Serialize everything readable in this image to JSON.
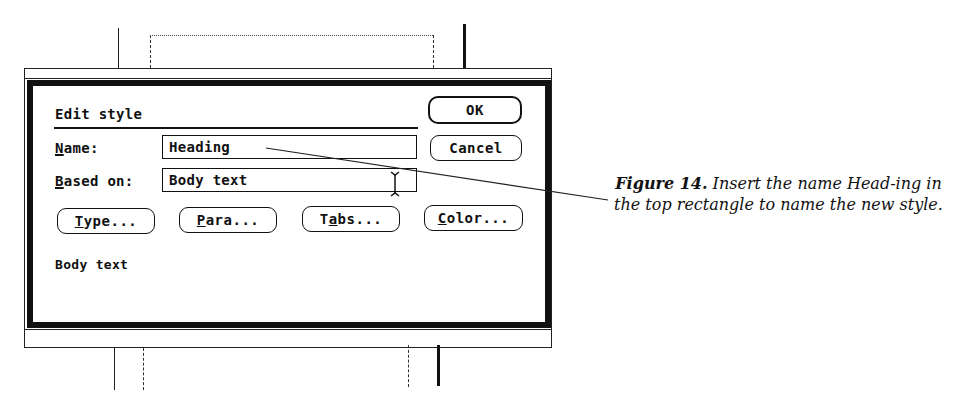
{
  "dialog": {
    "title": "Edit style",
    "name_label_mnemonic": "N",
    "name_label_rest": "ame:",
    "name_value": "Heading",
    "based_on_label_mnemonic": "B",
    "based_on_label_rest": "ased on:",
    "based_on_value": "Body text",
    "ok_label": "OK",
    "cancel_label": "Cancel",
    "buttons": [
      {
        "pre": "",
        "mnemonic": "T",
        "post": "ype..."
      },
      {
        "pre": "",
        "mnemonic": "P",
        "post": "ara..."
      },
      {
        "pre": "T",
        "mnemonic": "a",
        "post": "bs..."
      },
      {
        "pre": "",
        "mnemonic": "C",
        "post": "olor..."
      }
    ],
    "preview_text": "Body text"
  },
  "caption": {
    "figure_label": "Figure 14.",
    "text": " Insert the name Head-ing in the top rectangle to name the new style."
  },
  "icons": {
    "text_cursor": "i-beam-cursor-icon"
  },
  "colors": {
    "ink": "#111111",
    "paper": "#ffffff"
  }
}
